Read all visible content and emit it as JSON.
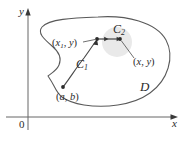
{
  "figure": {
    "background_color": "#ffffff",
    "stroke_color": "#555555",
    "curve_color": "#4a4a4a",
    "label_color": "#2b2b2b",
    "disk_shade_color": "#e8e8e8",
    "axes": {
      "x_label": "x",
      "y_label": "y",
      "origin_label": "0"
    },
    "labels": {
      "region": "D",
      "curve_first": "C",
      "curve_first_sub": "1",
      "curve_second": "C",
      "curve_second_sub": "2",
      "point_start_open": "(",
      "point_start_x": "a",
      "point_start_comma": ", ",
      "point_start_y": "b",
      "point_start_close": ")",
      "point_mid_open": "(",
      "point_mid_x": "x",
      "point_mid_x_sub": "1",
      "point_mid_comma": ", ",
      "point_mid_y": "y",
      "point_mid_close": ")",
      "point_end_open": "(",
      "point_end_x": "x",
      "point_end_comma": ", ",
      "point_end_y": "y",
      "point_end_close": ")"
    }
  }
}
